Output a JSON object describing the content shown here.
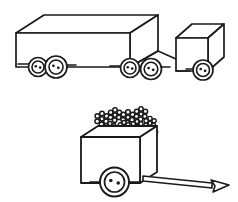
{
  "artwork": {
    "title": "Truck and Flower Cart Line Drawing",
    "style": "black and white outline coloring page",
    "background_color": "#ffffff",
    "ink_color": "#1a1a1a",
    "canvas": {
      "width": 238,
      "height": 202
    }
  },
  "objects": [
    {
      "id": "semi-truck",
      "label": "Semi truck with trailer",
      "parts": [
        {
          "id": "trailer-box",
          "label": "Cargo trailer box"
        },
        {
          "id": "tractor-cab",
          "label": "Tractor cab box"
        },
        {
          "id": "trailer-front-wheels",
          "label": "Trailer front wheel pair",
          "count": 2
        },
        {
          "id": "trailer-rear-wheels",
          "label": "Trailer rear wheel pair",
          "count": 2
        },
        {
          "id": "cab-wheel",
          "label": "Cab wheel",
          "count": 1
        }
      ],
      "wheel_total": 5
    },
    {
      "id": "flower-cart",
      "label": "Flower cart with tow handle",
      "parts": [
        {
          "id": "cart-box",
          "label": "Cart body box"
        },
        {
          "id": "cart-wheel",
          "label": "Cart wheel",
          "count": 1
        },
        {
          "id": "cart-axle",
          "label": "Cart axle bar"
        },
        {
          "id": "tow-handle",
          "label": "Tow handle with hitch end"
        },
        {
          "id": "flower-bunch",
          "label": "Bunch of flowers",
          "count": 9
        },
        {
          "id": "flower-stems",
          "label": "Flower stems",
          "count": 11
        }
      ]
    }
  ],
  "geometry": {
    "trailer_box": {
      "front_face": "16,33 16,67 130,67 130,33",
      "top_face": "16,33 44,15 158,15 130,33",
      "side_face": "130,33 158,15 158,50 130,67"
    },
    "cab_box": {
      "front_face": "176,38 176,71 208,71 208,38",
      "top_face": "176,38 192,24 224,24 208,38",
      "side_face": "208,38 224,24 224,57 208,71"
    },
    "cart_box": {
      "front_face": "81,137 81,183 140,183 140,137",
      "top_face": "81,137 98,126 157,126 140,137",
      "side_face": "140,137 157,126 157,172 140,183"
    },
    "wheels": [
      {
        "cx": 38,
        "cy": 67,
        "r_outer": 9.5,
        "r_inner": 6.0,
        "dots": 2
      },
      {
        "cx": 55,
        "cy": 67,
        "r_outer": 11.0,
        "r_inner": 7.0,
        "dots": 2
      },
      {
        "cx": 129,
        "cy": 68,
        "r_outer": 9.5,
        "r_inner": 6.0,
        "dots": 2
      },
      {
        "cx": 150,
        "cy": 69,
        "r_outer": 10.5,
        "r_inner": 6.5,
        "dots": 2
      },
      {
        "cx": 203,
        "cy": 70,
        "r_outer": 10.0,
        "r_inner": 6.5,
        "dots": 2
      },
      {
        "cx": 114,
        "cy": 182,
        "r_outer": 14.5,
        "r_inner": 10.0,
        "dots": 2
      }
    ],
    "flowers": [
      {
        "cx": 102,
        "cy": 119,
        "r": 6.5,
        "petals": 7,
        "stem_to": 137
      },
      {
        "cx": 115,
        "cy": 115,
        "r": 6.2,
        "petals": 7,
        "stem_to": 136
      },
      {
        "cx": 128,
        "cy": 117,
        "r": 6.5,
        "petals": 7,
        "stem_to": 136
      },
      {
        "cx": 141,
        "cy": 114,
        "r": 6.2,
        "petals": 7,
        "stem_to": 134
      },
      {
        "cx": 110,
        "cy": 128,
        "r": 5.6,
        "petals": 7,
        "stem_to": 137
      },
      {
        "cx": 124,
        "cy": 127,
        "r": 5.6,
        "petals": 7,
        "stem_to": 136
      },
      {
        "cx": 137,
        "cy": 126,
        "r": 5.6,
        "petals": 7,
        "stem_to": 134
      },
      {
        "cx": 150,
        "cy": 123,
        "r": 5.8,
        "petals": 7,
        "stem_to": 133
      },
      {
        "cx": 152,
        "cy": 134,
        "r": 5.4,
        "petals": 7,
        "stem_to": 133
      }
    ],
    "tow_handle": "142,178 210,187 227,185",
    "handle_tip": "210,181 228,185 213,192 216,186"
  }
}
